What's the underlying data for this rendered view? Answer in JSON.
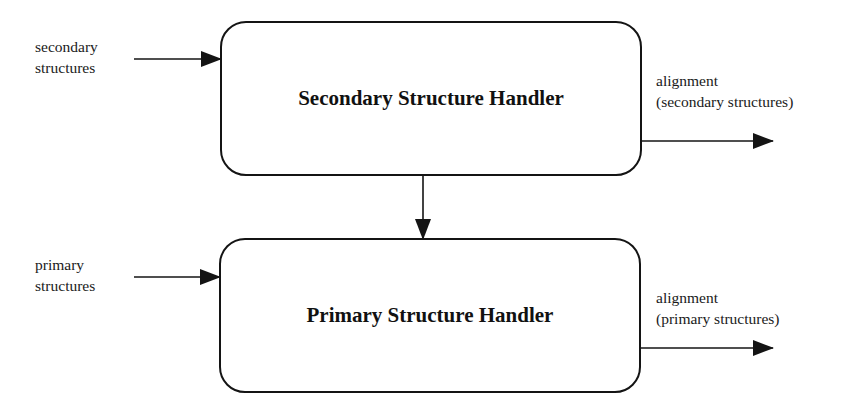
{
  "diagram": {
    "nodes": [
      {
        "id": "secondary-handler",
        "label": "Secondary Structure Handler"
      },
      {
        "id": "primary-handler",
        "label": "Primary Structure Handler"
      }
    ],
    "inputs": {
      "secondary": {
        "line1": "secondary",
        "line2": "structures"
      },
      "primary": {
        "line1": "primary",
        "line2": "structures"
      }
    },
    "outputs": {
      "secondary": {
        "line1": "alignment",
        "line2": "(secondary structures)"
      },
      "primary": {
        "line1": "alignment",
        "line2": "(primary structures)"
      }
    },
    "edges": [
      {
        "from": "secondary structures",
        "to": "secondary-handler"
      },
      {
        "from": "secondary-handler",
        "to": "alignment (secondary structures)"
      },
      {
        "from": "secondary-handler",
        "to": "primary-handler"
      },
      {
        "from": "primary structures",
        "to": "primary-handler"
      },
      {
        "from": "primary-handler",
        "to": "alignment (primary structures)"
      }
    ],
    "colors": {
      "stroke": "#141414",
      "background": "#ffffff",
      "text": "#111111"
    }
  }
}
